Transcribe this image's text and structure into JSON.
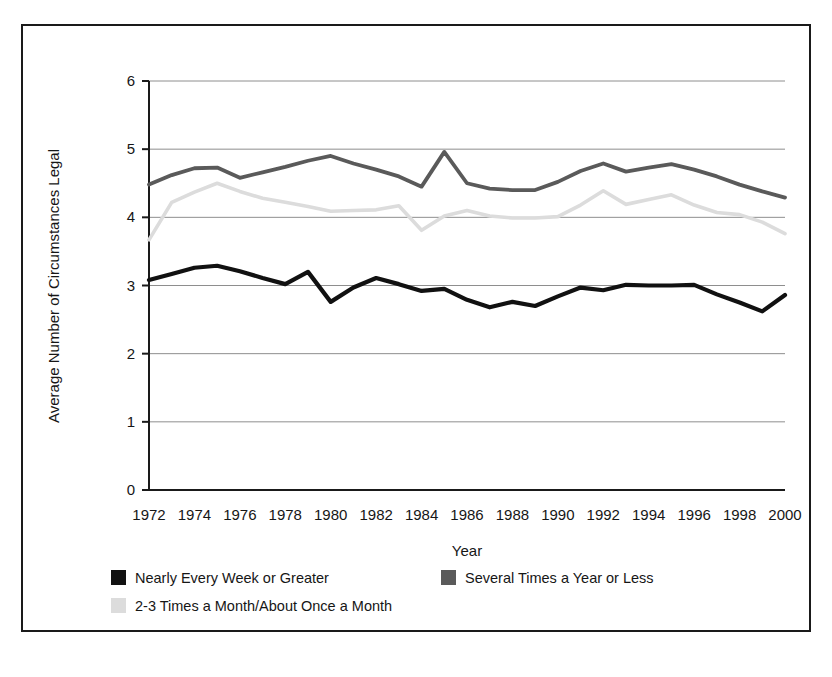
{
  "chart_data": {
    "type": "line",
    "title": "",
    "xlabel": "Year",
    "ylabel": "Average Number of Circumstances Legal",
    "xlim": [
      1972,
      2000
    ],
    "ylim": [
      0,
      6
    ],
    "grid": true,
    "legend_position": "bottom",
    "x_tick_labels": [
      "1972",
      "1974",
      "1976",
      "1978",
      "1980",
      "1982",
      "1984",
      "1986",
      "1988",
      "1990",
      "1992",
      "1994",
      "1996",
      "1998",
      "2000"
    ],
    "y_tick_labels": [
      "0",
      "1",
      "2",
      "3",
      "4",
      "5",
      "6"
    ],
    "x": [
      1972,
      1973,
      1974,
      1975,
      1976,
      1977,
      1978,
      1979,
      1980,
      1981,
      1982,
      1983,
      1984,
      1985,
      1986,
      1987,
      1988,
      1989,
      1990,
      1991,
      1992,
      1993,
      1994,
      1995,
      1996,
      1997,
      1998,
      1999,
      2000
    ],
    "series": [
      {
        "name": "Several Times a Year or Less",
        "color": "#5a5a5a",
        "values": [
          4.48,
          4.62,
          4.72,
          4.73,
          4.58,
          4.66,
          4.74,
          4.83,
          4.9,
          4.79,
          4.7,
          4.6,
          4.45,
          4.96,
          4.5,
          4.42,
          4.4,
          4.4,
          4.52,
          4.68,
          4.79,
          4.67,
          4.73,
          4.78,
          4.7,
          4.6,
          4.48,
          4.38,
          4.29
        ]
      },
      {
        "name": "2-3 Times a Month/About Once a Month",
        "color": "#dcdcdc",
        "values": [
          3.67,
          4.22,
          4.37,
          4.5,
          4.38,
          4.28,
          4.22,
          4.16,
          4.09,
          4.1,
          4.11,
          4.17,
          3.81,
          4.02,
          4.1,
          4.02,
          3.99,
          3.99,
          4.01,
          4.18,
          4.39,
          4.19,
          4.26,
          4.33,
          4.18,
          4.07,
          4.04,
          3.93,
          3.76
        ]
      },
      {
        "name": "Nearly Every Week or Greater",
        "color": "#111111",
        "values": [
          3.08,
          3.17,
          3.26,
          3.29,
          3.21,
          3.11,
          3.02,
          3.2,
          2.76,
          2.97,
          3.11,
          3.02,
          2.92,
          2.95,
          2.79,
          2.68,
          2.76,
          2.7,
          2.84,
          2.97,
          2.93,
          3.01,
          3.0,
          3.0,
          3.01,
          2.87,
          2.75,
          2.62,
          2.86
        ]
      }
    ],
    "legend_entries": [
      {
        "label": "Nearly Every Week or Greater",
        "color": "#111111"
      },
      {
        "label": "Several Times a Year or Less",
        "color": "#5a5a5a"
      },
      {
        "label": "2-3 Times a Month/About Once a Month",
        "color": "#dcdcdc"
      }
    ]
  }
}
